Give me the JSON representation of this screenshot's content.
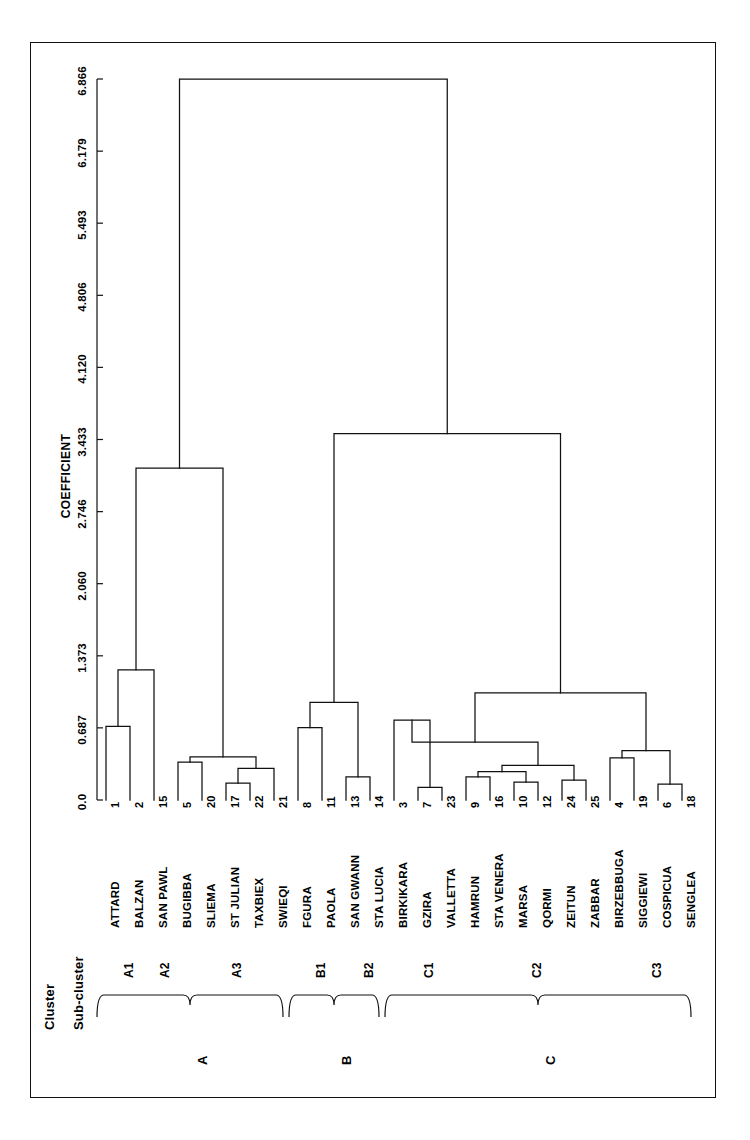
{
  "figure": {
    "axis_title": "COEFFICIENT",
    "row_headers": {
      "cluster": "Cluster",
      "subcluster": "Sub-cluster"
    }
  },
  "chart_data": {
    "type": "dendrogram",
    "title": "",
    "xlabel": "COEFFICIENT",
    "ylabel": "",
    "orientation": "horizontal-leaves-bottom",
    "axis_ticks": [
      "0.0",
      "0.687",
      "1.373",
      "2.060",
      "2.746",
      "3.433",
      "4.120",
      "4.806",
      "5.493",
      "6.179",
      "6.866"
    ],
    "axis_tick_values": [
      0.0,
      0.687,
      1.373,
      2.06,
      2.746,
      3.433,
      4.12,
      4.806,
      5.493,
      6.179,
      6.866
    ],
    "axis_range": [
      0.0,
      6.866
    ],
    "grid": false,
    "legend": "none",
    "leaves": [
      {
        "num": "1",
        "name": "ATTARD",
        "cluster": "A",
        "subcluster": "A1"
      },
      {
        "num": "2",
        "name": "BALZAN",
        "cluster": "A",
        "subcluster": "A1"
      },
      {
        "num": "15",
        "name": "SAN PAWL",
        "cluster": "A",
        "subcluster": "A2"
      },
      {
        "num": "5",
        "name": "BUGIBBA",
        "cluster": "A",
        "subcluster": "A3"
      },
      {
        "num": "20",
        "name": "SLIEMA",
        "cluster": "A",
        "subcluster": "A3"
      },
      {
        "num": "17",
        "name": "ST JULIAN",
        "cluster": "A",
        "subcluster": "A3"
      },
      {
        "num": "22",
        "name": "TAXBIEX",
        "cluster": "A",
        "subcluster": "A3"
      },
      {
        "num": "21",
        "name": "SWIEQI",
        "cluster": "A",
        "subcluster": "A3"
      },
      {
        "num": "8",
        "name": "FGURA",
        "cluster": "B",
        "subcluster": "B1"
      },
      {
        "num": "11",
        "name": "PAOLA",
        "cluster": "B",
        "subcluster": "B1"
      },
      {
        "num": "13",
        "name": "SAN GWANN",
        "cluster": "B",
        "subcluster": "B2"
      },
      {
        "num": "14",
        "name": "STA LUCIA",
        "cluster": "B",
        "subcluster": "B2"
      },
      {
        "num": "3",
        "name": "BIRKIKARA",
        "cluster": "C",
        "subcluster": "C1"
      },
      {
        "num": "7",
        "name": "GZIRA",
        "cluster": "C",
        "subcluster": "C1"
      },
      {
        "num": "23",
        "name": "VALLETTA",
        "cluster": "C",
        "subcluster": "C1"
      },
      {
        "num": "9",
        "name": "HAMRUN",
        "cluster": "C",
        "subcluster": "C2"
      },
      {
        "num": "16",
        "name": "STA VENERA",
        "cluster": "C",
        "subcluster": "C2"
      },
      {
        "num": "10",
        "name": "MARSA",
        "cluster": "C",
        "subcluster": "C2"
      },
      {
        "num": "12",
        "name": "QORMI",
        "cluster": "C",
        "subcluster": "C2"
      },
      {
        "num": "24",
        "name": "ZEITUN",
        "cluster": "C",
        "subcluster": "C2"
      },
      {
        "num": "25",
        "name": "ZABBAR",
        "cluster": "C",
        "subcluster": "C2"
      },
      {
        "num": "4",
        "name": "BIRZEBBUGA",
        "cluster": "C",
        "subcluster": "C3"
      },
      {
        "num": "19",
        "name": "SIGGIEWI",
        "cluster": "C",
        "subcluster": "C3"
      },
      {
        "num": "6",
        "name": "COSPICUA",
        "cluster": "C",
        "subcluster": "C3"
      },
      {
        "num": "18",
        "name": "SENGLEA",
        "cluster": "C",
        "subcluster": "C3"
      }
    ],
    "merges": [
      {
        "id": "m1",
        "left": "1",
        "right": "2",
        "height": 0.7
      },
      {
        "id": "m2",
        "left": "m1",
        "right": "15",
        "height": 1.24
      },
      {
        "id": "m3",
        "left": "5",
        "right": "20",
        "height": 0.36
      },
      {
        "id": "m4",
        "left": "17",
        "right": "22",
        "height": 0.16
      },
      {
        "id": "m5",
        "left": "m4",
        "right": "21",
        "height": 0.3
      },
      {
        "id": "m6",
        "left": "m3",
        "right": "m5",
        "height": 0.41
      },
      {
        "id": "m7",
        "left": "m2",
        "right": "m6",
        "height": 3.16
      },
      {
        "id": "m8",
        "left": "8",
        "right": "11",
        "height": 0.69
      },
      {
        "id": "m9",
        "left": "13",
        "right": "14",
        "height": 0.22
      },
      {
        "id": "m10",
        "left": "m8",
        "right": "m9",
        "height": 0.93
      },
      {
        "id": "m11",
        "left": "7",
        "right": "23",
        "height": 0.12
      },
      {
        "id": "m12",
        "left": "3",
        "right": "m11",
        "height": 0.76
      },
      {
        "id": "m13",
        "left": "9",
        "right": "16",
        "height": 0.22
      },
      {
        "id": "m14",
        "left": "10",
        "right": "12",
        "height": 0.17
      },
      {
        "id": "m15",
        "left": "m13",
        "right": "m14",
        "height": 0.27
      },
      {
        "id": "m16",
        "left": "24",
        "right": "25",
        "height": 0.19
      },
      {
        "id": "m17",
        "left": "m15",
        "right": "m16",
        "height": 0.33
      },
      {
        "id": "m18",
        "left": "m12",
        "right": "m17",
        "height": 0.55
      },
      {
        "id": "m19",
        "left": "4",
        "right": "19",
        "height": 0.4
      },
      {
        "id": "m20",
        "left": "6",
        "right": "18",
        "height": 0.15
      },
      {
        "id": "m21",
        "left": "m19",
        "right": "m20",
        "height": 0.47
      },
      {
        "id": "m22",
        "left": "m18",
        "right": "m21",
        "height": 1.02
      },
      {
        "id": "m23",
        "left": "m10",
        "right": "m22",
        "height": 3.49
      },
      {
        "id": "m24",
        "left": "m7",
        "right": "m23",
        "height": 6.866
      }
    ],
    "clusters": [
      {
        "label": "A",
        "first_leaf": 0,
        "last_leaf": 7
      },
      {
        "label": "B",
        "first_leaf": 8,
        "last_leaf": 11
      },
      {
        "label": "C",
        "first_leaf": 12,
        "last_leaf": 24
      }
    ],
    "subclusters": [
      {
        "label": "A1",
        "first_leaf": 0,
        "last_leaf": 1
      },
      {
        "label": "A2",
        "first_leaf": 2,
        "last_leaf": 2
      },
      {
        "label": "A3",
        "first_leaf": 3,
        "last_leaf": 7
      },
      {
        "label": "B1",
        "first_leaf": 8,
        "last_leaf": 9
      },
      {
        "label": "B2",
        "first_leaf": 10,
        "last_leaf": 11
      },
      {
        "label": "C1",
        "first_leaf": 12,
        "last_leaf": 14
      },
      {
        "label": "C2",
        "first_leaf": 15,
        "last_leaf": 20
      },
      {
        "label": "C3",
        "first_leaf": 21,
        "last_leaf": 24
      }
    ],
    "colors": {
      "line": "#111111",
      "frame": "#111111",
      "text": "#000000",
      "background": "#ffffff"
    }
  }
}
